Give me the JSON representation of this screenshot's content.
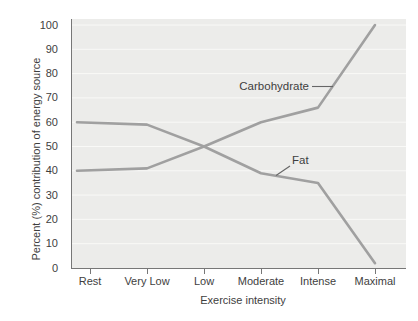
{
  "figure": {
    "background": "#ffffff"
  },
  "chart_data": {
    "type": "line",
    "categories": [
      "Rest",
      "Very Low",
      "Low",
      "Moderate",
      "Intense",
      "Maximal"
    ],
    "series": [
      {
        "name": "Carbohydrate",
        "values": [
          40,
          41,
          50,
          60,
          66,
          100
        ]
      },
      {
        "name": "Fat",
        "values": [
          60,
          59,
          50,
          39,
          35,
          2
        ]
      }
    ],
    "title": "",
    "xlabel": "Exercise intensity",
    "ylabel": "Percent (%) contribution of energy source",
    "ylim": [
      0,
      100
    ],
    "yticks": [
      0,
      10,
      20,
      30,
      40,
      50,
      60,
      70,
      80,
      90,
      100
    ],
    "grid": "horizontal",
    "legend": "inline-annotations"
  },
  "style": {
    "plot_background": "#ececea",
    "gridline_color": "#f9f9f7",
    "axis_color": "#777777",
    "line_color": "#a0a0a0",
    "leader_color": "#666666",
    "text_color": "#3e3e3e"
  }
}
